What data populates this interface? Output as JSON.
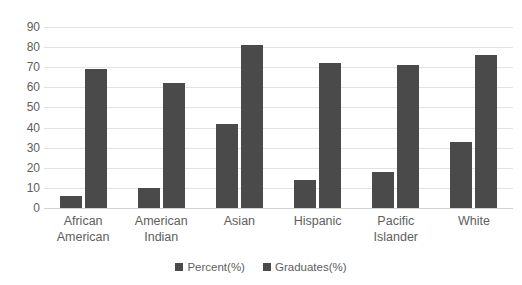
{
  "chart_data": {
    "type": "bar",
    "title": "",
    "xlabel": "",
    "ylabel": "",
    "ylim": [
      0,
      90
    ],
    "ytick_step": 10,
    "yticks": [
      90,
      80,
      70,
      60,
      50,
      40,
      30,
      20,
      10,
      0
    ],
    "grid": true,
    "legend_position": "bottom",
    "categories": [
      "African American",
      "American Indian",
      "Asian",
      "Hispanic",
      "Pacific Islander",
      "White"
    ],
    "category_lines": [
      [
        "African",
        "American"
      ],
      [
        "American",
        "Indian"
      ],
      [
        "Asian",
        ""
      ],
      [
        "Hispanic",
        ""
      ],
      [
        "Pacific",
        "Islander"
      ],
      [
        "White",
        ""
      ]
    ],
    "series": [
      {
        "name": "Percent(%)",
        "color": "#4a4a4a",
        "values": [
          6,
          10,
          42,
          14,
          18,
          33
        ]
      },
      {
        "name": "Graduates(%)",
        "color": "#4a4a4a",
        "values": [
          69,
          62,
          81,
          72,
          71,
          76
        ]
      }
    ]
  },
  "colors": {
    "bar": "#4a4a4a",
    "gridline": "#e2e2e2",
    "baseline": "#d2d2d2",
    "text": "#5e5e5e",
    "background": "#ffffff"
  }
}
